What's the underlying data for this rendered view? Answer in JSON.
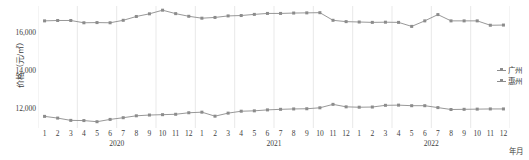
{
  "chart_data": {
    "type": "line",
    "title": "",
    "xlabel": "年月",
    "ylabel": "价格（元/㎡）",
    "ylim": [
      11000,
      17400
    ],
    "yticks": [
      12000,
      14000,
      16000
    ],
    "ytick_labels": [
      "12,000",
      "14,000",
      "16,000"
    ],
    "grid": true,
    "grid_axis": "x",
    "legend_position": "right",
    "x": [
      "1",
      "2",
      "3",
      "4",
      "5",
      "6",
      "7",
      "8",
      "9",
      "10",
      "11",
      "12",
      "1",
      "2",
      "3",
      "4",
      "5",
      "6",
      "7",
      "8",
      "9",
      "10",
      "11",
      "12",
      "1",
      "2",
      "3",
      "4",
      "5",
      "6",
      "7",
      "8",
      "9",
      "10",
      "11",
      "12"
    ],
    "x_groups": [
      {
        "label": "2020",
        "start": 0,
        "end": 11
      },
      {
        "label": "2021",
        "start": 12,
        "end": 23
      },
      {
        "label": "2022",
        "start": 24,
        "end": 35
      }
    ],
    "series": [
      {
        "name": "广州",
        "color": "#8c8c8c",
        "values": [
          16620,
          16640,
          16640,
          16520,
          16530,
          16520,
          16650,
          16850,
          16990,
          17180,
          17000,
          16860,
          16760,
          16800,
          16880,
          16900,
          16960,
          17010,
          17010,
          17030,
          17040,
          17050,
          16650,
          16580,
          16560,
          16540,
          16550,
          16540,
          16330,
          16620,
          16950,
          16620,
          16620,
          16620,
          16390,
          16400
        ]
      },
      {
        "name": "惠州",
        "color": "#8c8c8c",
        "values": [
          11610,
          11520,
          11400,
          11390,
          11330,
          11450,
          11540,
          11640,
          11680,
          11700,
          11720,
          11800,
          11830,
          11620,
          11780,
          11880,
          11900,
          11950,
          11980,
          12000,
          12010,
          12060,
          12240,
          12110,
          12090,
          12100,
          12190,
          12200,
          12170,
          12170,
          12070,
          11970,
          11980,
          11990,
          12000,
          12000
        ]
      }
    ]
  },
  "legend": {
    "items": [
      {
        "label": "广州"
      },
      {
        "label": "惠州"
      }
    ]
  },
  "axes": {
    "y_title": "价格（元/㎡）",
    "x_caption": "年月"
  }
}
